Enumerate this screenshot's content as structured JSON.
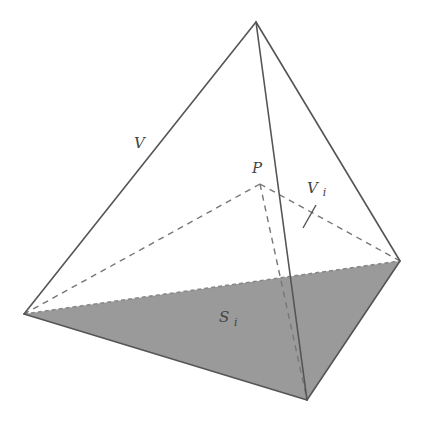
{
  "diagram": {
    "colors": {
      "background": "#ffffff",
      "edge": "#555555",
      "dashed_edge": "#777777",
      "shaded_face": "#9a9a9a"
    },
    "vertices": {
      "apex": {
        "x": 256,
        "y": 22
      },
      "left": {
        "x": 24,
        "y": 314
      },
      "right": {
        "x": 400,
        "y": 261
      },
      "bottom": {
        "x": 307,
        "y": 400
      },
      "P": {
        "x": 260,
        "y": 184
      }
    },
    "shaded_face": {
      "label": "S",
      "subscript": "i",
      "vertices": [
        "left",
        "right",
        "bottom"
      ]
    },
    "labels": {
      "V": {
        "text": "V",
        "x": 134,
        "y": 148
      },
      "P": {
        "text": "P",
        "x": 252,
        "y": 173
      },
      "Vi": {
        "text": "V",
        "sub": "i",
        "x": 307,
        "y": 193
      },
      "Si": {
        "text": "S",
        "sub": "i",
        "x": 219,
        "y": 322
      }
    },
    "tick": {
      "x1": 303,
      "y1": 228,
      "x2": 316,
      "y2": 205
    }
  }
}
